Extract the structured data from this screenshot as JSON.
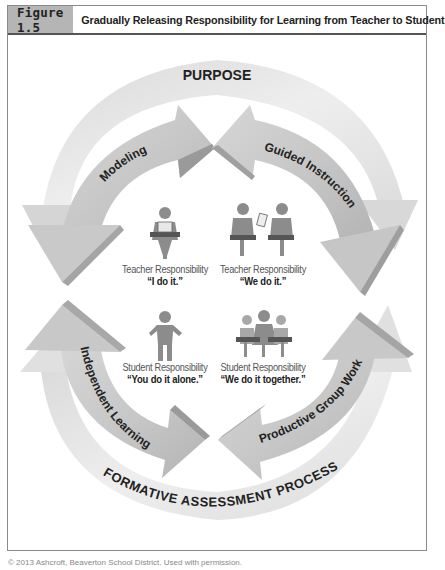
{
  "figure": {
    "label": "Figure 1.5",
    "title": "Gradually Releasing Responsibility for Learning from Teacher to Student"
  },
  "outer_arcs": {
    "top": "PURPOSE",
    "bottom": "FORMATIVE ASSESSMENT PROCESS"
  },
  "inner_arrows": {
    "top_left": "Modeling",
    "top_right": "Guided Instruction",
    "bottom_left": "Independent Learning",
    "bottom_right": "Productive Group Work"
  },
  "quadrants": [
    {
      "icon": "teacher-reading-icon",
      "role": "Teacher Responsibility",
      "quote": "“I do it.”"
    },
    {
      "icon": "teacher-student-sharing-icon",
      "role": "Teacher Responsibility",
      "quote": "“We do it.”"
    },
    {
      "icon": "student-standing-icon",
      "role": "Student Responsibility",
      "quote": "“You do it alone.”"
    },
    {
      "icon": "student-group-icon",
      "role": "Student Responsibility",
      "quote": "“We do it together.”"
    }
  ],
  "colors": {
    "outer_arc": "#e6e6e6",
    "inner_arrow": "#cfcfcf",
    "inner_arrow_edge": "#9a9a9a",
    "figure_label_bg": "#b5b5b5",
    "icon": "#8c8c8c"
  },
  "footer": "© 2013 Ashcroft, Beaverton School District. Used with permission."
}
